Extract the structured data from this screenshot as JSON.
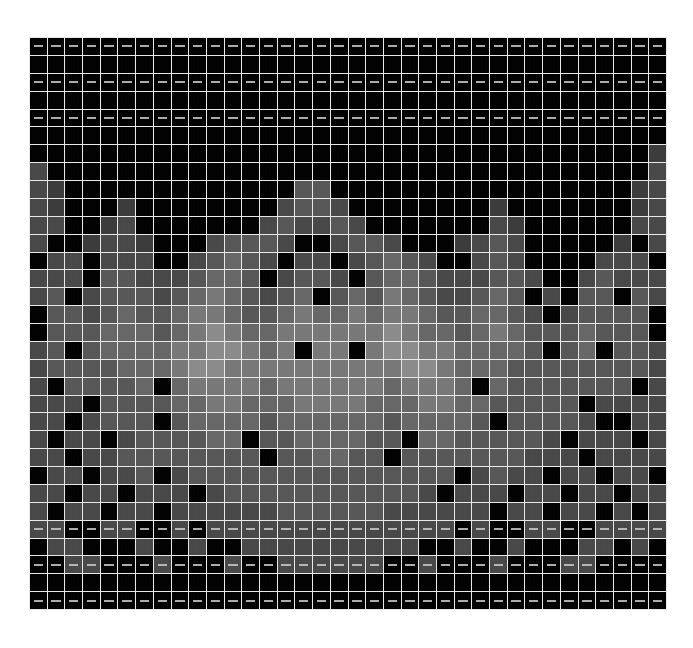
{
  "figure": {
    "title": "",
    "background_color": "#ffffff",
    "plot_background_color": "#000000",
    "gridline_color": "#e8e8e8",
    "dash_marker_color": "#c9c9c9"
  },
  "chart_data": {
    "type": "heatmap",
    "title": "",
    "xlabel": "",
    "ylabel": "",
    "grid": true,
    "legend": "none",
    "colormap": "grayscale",
    "vmin": 0,
    "vmax": 9,
    "n_columns": 36,
    "n_rows": 32,
    "x_tick_labels": [],
    "y_tick_labels": [],
    "annotations": [
      "faint horizontal dash markers appear centered in every cell of rows 0, 2, 4, 27, 29 and 31"
    ],
    "dash_marker_rows": [
      0,
      2,
      4,
      27,
      29,
      31
    ],
    "color_levels": [
      "#000000",
      "#1a1a1a",
      "#242424",
      "#2e2e2e",
      "#3a3a3a",
      "#474747",
      "#565656",
      "#666666",
      "#777777",
      "#8a8a8a"
    ],
    "values": [
      [
        0,
        0,
        0,
        0,
        0,
        0,
        0,
        0,
        0,
        0,
        0,
        0,
        0,
        0,
        0,
        0,
        0,
        0,
        0,
        0,
        0,
        0,
        0,
        0,
        0,
        0,
        0,
        0,
        0,
        0,
        0,
        0,
        0,
        0,
        0,
        0
      ],
      [
        0,
        0,
        0,
        0,
        0,
        0,
        0,
        0,
        0,
        0,
        0,
        0,
        0,
        0,
        0,
        0,
        0,
        0,
        0,
        0,
        0,
        0,
        0,
        0,
        0,
        0,
        0,
        0,
        0,
        0,
        0,
        0,
        0,
        0,
        0,
        0
      ],
      [
        0,
        0,
        0,
        0,
        0,
        0,
        0,
        0,
        0,
        0,
        0,
        0,
        0,
        0,
        0,
        0,
        0,
        0,
        0,
        0,
        0,
        0,
        0,
        0,
        0,
        0,
        0,
        0,
        0,
        0,
        0,
        0,
        0,
        0,
        0,
        0
      ],
      [
        0,
        0,
        0,
        0,
        0,
        0,
        0,
        0,
        0,
        0,
        0,
        0,
        0,
        0,
        0,
        0,
        0,
        0,
        0,
        0,
        0,
        0,
        0,
        0,
        0,
        0,
        0,
        0,
        0,
        0,
        0,
        0,
        0,
        0,
        0,
        0
      ],
      [
        0,
        0,
        0,
        0,
        0,
        0,
        0,
        0,
        0,
        0,
        0,
        0,
        0,
        0,
        0,
        0,
        0,
        0,
        0,
        0,
        0,
        0,
        0,
        0,
        0,
        0,
        0,
        0,
        0,
        0,
        0,
        0,
        0,
        0,
        0,
        0
      ],
      [
        0,
        0,
        0,
        0,
        0,
        0,
        0,
        0,
        0,
        0,
        0,
        0,
        0,
        0,
        0,
        0,
        0,
        0,
        0,
        0,
        0,
        0,
        0,
        0,
        0,
        0,
        0,
        0,
        0,
        0,
        0,
        0,
        0,
        0,
        0,
        0
      ],
      [
        0,
        0,
        0,
        0,
        0,
        0,
        0,
        0,
        0,
        0,
        0,
        0,
        0,
        0,
        0,
        0,
        0,
        0,
        0,
        0,
        0,
        0,
        0,
        0,
        0,
        0,
        0,
        0,
        0,
        0,
        0,
        0,
        0,
        0,
        0,
        4
      ],
      [
        5,
        0,
        0,
        0,
        0,
        0,
        0,
        0,
        0,
        0,
        0,
        0,
        0,
        0,
        0,
        0,
        0,
        0,
        0,
        0,
        0,
        0,
        0,
        0,
        0,
        0,
        0,
        0,
        0,
        0,
        0,
        0,
        0,
        0,
        0,
        5
      ],
      [
        5,
        4,
        0,
        0,
        0,
        0,
        0,
        0,
        0,
        0,
        0,
        0,
        0,
        0,
        0,
        6,
        6,
        0,
        0,
        0,
        0,
        0,
        0,
        0,
        0,
        0,
        0,
        0,
        0,
        0,
        0,
        0,
        0,
        0,
        4,
        5
      ],
      [
        5,
        4,
        0,
        0,
        0,
        4,
        0,
        0,
        0,
        0,
        0,
        0,
        0,
        0,
        5,
        6,
        6,
        5,
        0,
        0,
        0,
        0,
        0,
        0,
        0,
        0,
        4,
        0,
        0,
        0,
        0,
        0,
        0,
        0,
        4,
        5
      ],
      [
        5,
        5,
        0,
        0,
        4,
        5,
        0,
        0,
        0,
        0,
        0,
        0,
        0,
        5,
        6,
        5,
        5,
        6,
        5,
        0,
        0,
        0,
        0,
        0,
        0,
        0,
        5,
        4,
        0,
        0,
        0,
        0,
        0,
        0,
        5,
        5
      ],
      [
        5,
        0,
        0,
        4,
        5,
        5,
        4,
        0,
        0,
        0,
        5,
        6,
        6,
        6,
        5,
        0,
        0,
        5,
        6,
        6,
        5,
        0,
        0,
        0,
        4,
        5,
        6,
        5,
        0,
        0,
        0,
        0,
        0,
        4,
        0,
        5
      ],
      [
        0,
        5,
        5,
        0,
        5,
        5,
        5,
        0,
        0,
        5,
        6,
        7,
        6,
        5,
        0,
        5,
        5,
        0,
        5,
        6,
        7,
        6,
        5,
        0,
        0,
        5,
        6,
        5,
        0,
        0,
        0,
        0,
        5,
        5,
        5,
        0
      ],
      [
        5,
        5,
        5,
        0,
        6,
        6,
        5,
        5,
        5,
        6,
        7,
        7,
        6,
        0,
        5,
        6,
        6,
        5,
        0,
        6,
        7,
        7,
        6,
        5,
        5,
        5,
        6,
        6,
        5,
        0,
        0,
        5,
        6,
        5,
        5,
        5
      ],
      [
        5,
        6,
        0,
        5,
        6,
        6,
        6,
        5,
        6,
        7,
        8,
        7,
        6,
        5,
        6,
        7,
        0,
        6,
        7,
        6,
        8,
        7,
        6,
        5,
        5,
        6,
        7,
        6,
        0,
        5,
        0,
        6,
        6,
        0,
        6,
        5
      ],
      [
        0,
        6,
        6,
        5,
        6,
        7,
        6,
        6,
        7,
        8,
        8,
        7,
        6,
        6,
        7,
        8,
        7,
        7,
        8,
        7,
        8,
        8,
        7,
        6,
        6,
        7,
        7,
        6,
        5,
        0,
        5,
        6,
        6,
        6,
        6,
        0
      ],
      [
        0,
        6,
        6,
        6,
        7,
        7,
        7,
        6,
        7,
        8,
        9,
        8,
        7,
        7,
        8,
        8,
        8,
        8,
        8,
        8,
        9,
        8,
        7,
        7,
        6,
        7,
        8,
        7,
        6,
        6,
        6,
        7,
        6,
        6,
        6,
        0
      ],
      [
        5,
        6,
        0,
        6,
        7,
        7,
        7,
        7,
        8,
        8,
        9,
        9,
        8,
        7,
        8,
        0,
        8,
        8,
        0,
        8,
        9,
        9,
        8,
        8,
        7,
        7,
        7,
        7,
        6,
        0,
        6,
        7,
        0,
        6,
        6,
        5
      ],
      [
        5,
        6,
        6,
        6,
        6,
        7,
        7,
        7,
        8,
        9,
        9,
        8,
        8,
        8,
        8,
        8,
        8,
        8,
        8,
        8,
        8,
        9,
        9,
        8,
        7,
        7,
        7,
        6,
        6,
        6,
        6,
        6,
        6,
        6,
        6,
        5
      ],
      [
        5,
        0,
        6,
        6,
        6,
        6,
        7,
        0,
        7,
        8,
        8,
        8,
        8,
        7,
        8,
        8,
        8,
        8,
        8,
        8,
        7,
        8,
        8,
        8,
        7,
        0,
        7,
        6,
        6,
        6,
        6,
        6,
        6,
        6,
        0,
        5
      ],
      [
        5,
        5,
        5,
        0,
        6,
        6,
        6,
        6,
        7,
        7,
        8,
        8,
        7,
        7,
        7,
        8,
        8,
        8,
        8,
        7,
        7,
        7,
        8,
        8,
        7,
        7,
        6,
        6,
        6,
        6,
        6,
        0,
        5,
        5,
        5,
        5
      ],
      [
        5,
        5,
        0,
        5,
        6,
        6,
        6,
        0,
        6,
        7,
        7,
        7,
        7,
        6,
        7,
        7,
        7,
        7,
        7,
        7,
        6,
        7,
        7,
        7,
        7,
        6,
        0,
        6,
        6,
        6,
        6,
        5,
        0,
        0,
        5,
        5
      ],
      [
        5,
        0,
        5,
        5,
        0,
        5,
        6,
        6,
        6,
        6,
        7,
        7,
        0,
        6,
        6,
        7,
        7,
        7,
        7,
        6,
        6,
        0,
        7,
        7,
        6,
        6,
        6,
        6,
        6,
        5,
        0,
        5,
        5,
        5,
        0,
        5
      ],
      [
        5,
        5,
        0,
        5,
        5,
        6,
        6,
        6,
        6,
        6,
        6,
        6,
        6,
        0,
        6,
        6,
        7,
        7,
        6,
        6,
        0,
        6,
        6,
        6,
        6,
        6,
        6,
        6,
        5,
        5,
        5,
        0,
        5,
        5,
        5,
        5
      ],
      [
        0,
        5,
        5,
        0,
        5,
        5,
        6,
        0,
        5,
        6,
        6,
        6,
        6,
        6,
        6,
        6,
        6,
        6,
        6,
        6,
        6,
        6,
        6,
        6,
        0,
        5,
        6,
        5,
        5,
        0,
        5,
        5,
        0,
        5,
        5,
        0
      ],
      [
        5,
        5,
        0,
        5,
        5,
        0,
        5,
        5,
        5,
        0,
        5,
        6,
        6,
        6,
        6,
        6,
        6,
        6,
        6,
        6,
        6,
        6,
        5,
        0,
        5,
        5,
        5,
        0,
        5,
        5,
        0,
        5,
        5,
        0,
        5,
        5
      ],
      [
        5,
        0,
        5,
        5,
        0,
        5,
        5,
        0,
        5,
        5,
        5,
        5,
        5,
        5,
        6,
        6,
        6,
        6,
        6,
        6,
        5,
        5,
        5,
        5,
        5,
        5,
        0,
        5,
        5,
        0,
        5,
        5,
        0,
        5,
        0,
        5
      ],
      [
        5,
        5,
        0,
        0,
        5,
        5,
        0,
        0,
        5,
        0,
        5,
        5,
        5,
        5,
        5,
        5,
        5,
        5,
        5,
        5,
        5,
        5,
        5,
        5,
        0,
        5,
        0,
        0,
        5,
        5,
        0,
        0,
        5,
        5,
        5,
        5
      ],
      [
        0,
        5,
        5,
        0,
        0,
        0,
        5,
        0,
        0,
        5,
        0,
        0,
        5,
        5,
        5,
        5,
        5,
        5,
        5,
        5,
        5,
        5,
        0,
        0,
        5,
        0,
        0,
        5,
        0,
        0,
        0,
        5,
        5,
        0,
        5,
        0
      ],
      [
        0,
        0,
        5,
        5,
        0,
        0,
        0,
        5,
        0,
        0,
        0,
        5,
        0,
        0,
        5,
        5,
        5,
        5,
        5,
        5,
        0,
        0,
        5,
        0,
        0,
        0,
        5,
        0,
        0,
        0,
        5,
        5,
        0,
        0,
        0,
        0
      ],
      [
        0,
        0,
        0,
        0,
        0,
        0,
        0,
        0,
        0,
        0,
        0,
        0,
        0,
        0,
        0,
        0,
        0,
        0,
        0,
        0,
        0,
        0,
        0,
        0,
        0,
        0,
        0,
        0,
        0,
        0,
        0,
        0,
        0,
        0,
        0,
        0
      ],
      [
        0,
        0,
        0,
        0,
        0,
        0,
        0,
        0,
        0,
        0,
        0,
        0,
        0,
        0,
        0,
        0,
        0,
        0,
        0,
        0,
        0,
        0,
        0,
        0,
        0,
        0,
        0,
        0,
        0,
        0,
        0,
        0,
        0,
        0,
        0,
        0
      ]
    ]
  }
}
